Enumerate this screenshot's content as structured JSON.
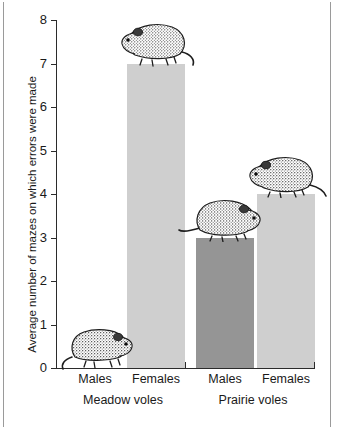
{
  "chart_data": {
    "type": "bar",
    "title": "",
    "subtitle": "",
    "xlabel": "",
    "ylabel": "Average number of mazes on which errors were made",
    "ylim": [
      0,
      8
    ],
    "ytick_labels": [
      "0",
      "1",
      "2",
      "3",
      "4",
      "5",
      "6",
      "7",
      "8"
    ],
    "ytick_values": [
      0,
      1,
      2,
      3,
      4,
      5,
      6,
      7,
      8
    ],
    "grid": false,
    "legend": "none",
    "categories": [
      "Males",
      "Females",
      "Males",
      "Females"
    ],
    "values": [
      0,
      7,
      3,
      4
    ],
    "groups": [
      {
        "name": "Meadow voles",
        "bars": [
          {
            "label": "Males",
            "value": 0,
            "color": "#8f8f8f"
          },
          {
            "label": "Females",
            "value": 7,
            "color": "#cfcfcf"
          }
        ]
      },
      {
        "name": "Prairie voles",
        "bars": [
          {
            "label": "Males",
            "value": 3,
            "color": "#959595"
          },
          {
            "label": "Females",
            "value": 4,
            "color": "#cfcfcf"
          }
        ]
      }
    ],
    "annotations": [
      {
        "name": "vole-illustration-meadow-males",
        "on_bar": "Meadow voles / Males"
      },
      {
        "name": "vole-illustration-meadow-females",
        "on_bar": "Meadow voles / Females"
      },
      {
        "name": "vole-illustration-prairie-males",
        "on_bar": "Prairie voles / Males"
      },
      {
        "name": "vole-illustration-prairie-females",
        "on_bar": "Prairie voles / Females"
      }
    ]
  },
  "axis": {
    "y_title": "Average number of mazes on which errors were made",
    "ticks": [
      "8",
      "7",
      "6",
      "5",
      "4",
      "3",
      "2",
      "1",
      "0"
    ]
  },
  "labels": {
    "cat_1": "Males",
    "cat_2": "Females",
    "cat_3": "Males",
    "cat_4": "Females",
    "group_1": "Meadow voles",
    "group_2": "Prairie voles"
  },
  "colors": {
    "bar_light": "#cfcfcf",
    "bar_dark": "#959595",
    "axis": "#2b2b2b",
    "frame": "#9a9a9a",
    "background": "#ffffff",
    "text": "#1a1a1a"
  }
}
